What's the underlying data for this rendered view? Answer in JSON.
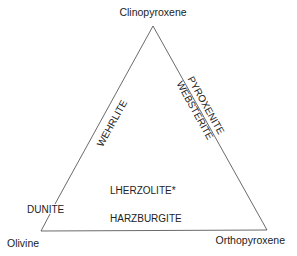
{
  "diagram": {
    "type": "ternary",
    "vertices": {
      "top": "Clinopyroxene",
      "bottom_left": "Olivine",
      "bottom_right": "Orthopyroxene"
    },
    "fields": {
      "dunite": "DUNITE",
      "wehrlite": "WEHRLITE",
      "pyroxenite": "PYROXENITE",
      "websterite": "WEBSTERITE",
      "lherzolite": "LHERZOLITE*",
      "harzburgite": "HARZBURGITE"
    },
    "colors": {
      "line": "#444444",
      "text": "#222222",
      "background": "#ffffff"
    }
  }
}
